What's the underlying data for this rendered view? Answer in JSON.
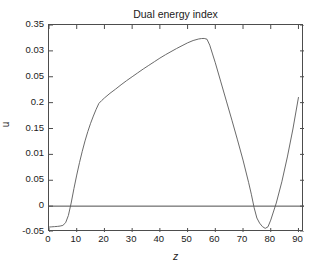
{
  "chart_data": {
    "type": "line",
    "title": "Dual energy index",
    "xlabel": "z",
    "ylabel": "u",
    "grid": false,
    "legend": null,
    "xlim": [
      0,
      92
    ],
    "ylim": [
      -0.05,
      0.35
    ],
    "xticks": [
      "0",
      "10",
      "20",
      "30",
      "40",
      "50",
      "60",
      "70",
      "80",
      "90"
    ],
    "xtick_values": [
      0,
      10,
      20,
      30,
      40,
      50,
      60,
      70,
      80,
      90
    ],
    "yticks": [
      "0.35",
      "0.03",
      "0.05",
      "0.2",
      "0.15",
      "0.01",
      "0.05",
      "0",
      "-0.05"
    ],
    "ytick_positions": [
      0.35,
      0.3,
      0.25,
      0.2,
      0.15,
      0.1,
      0.05,
      0.0,
      -0.05
    ],
    "zero_line": 0,
    "series": [
      {
        "name": "u",
        "color": "#595959",
        "x": [
          0,
          1,
          2,
          3,
          4,
          5,
          6,
          7,
          8,
          9,
          10,
          11,
          12,
          13,
          14,
          15,
          16,
          17,
          18,
          19,
          20,
          22,
          24,
          26,
          28,
          30,
          32,
          34,
          36,
          38,
          40,
          42,
          44,
          46,
          48,
          50,
          52,
          54,
          55,
          56,
          57,
          58,
          59,
          60,
          62,
          64,
          66,
          68,
          70,
          72,
          73,
          74,
          75,
          76,
          77,
          78,
          79,
          80,
          82,
          84,
          86,
          88,
          90
        ],
        "y": [
          -0.0405,
          -0.04,
          -0.0396,
          -0.0392,
          -0.0385,
          -0.0372,
          -0.032,
          -0.018,
          0.006,
          0.034,
          0.06,
          0.084,
          0.106,
          0.126,
          0.144,
          0.16,
          0.174,
          0.187,
          0.1985,
          0.204,
          0.209,
          0.218,
          0.226,
          0.2345,
          0.2425,
          0.25,
          0.2575,
          0.265,
          0.272,
          0.279,
          0.286,
          0.2925,
          0.2985,
          0.3045,
          0.31,
          0.3155,
          0.32,
          0.323,
          0.3238,
          0.324,
          0.3225,
          0.311,
          0.294,
          0.277,
          0.24,
          0.203,
          0.166,
          0.128,
          0.089,
          0.046,
          0.023,
          -0.003,
          -0.023,
          -0.033,
          -0.0395,
          -0.043,
          -0.04,
          -0.027,
          0.006,
          0.047,
          0.095,
          0.149,
          0.21
        ]
      }
    ]
  }
}
